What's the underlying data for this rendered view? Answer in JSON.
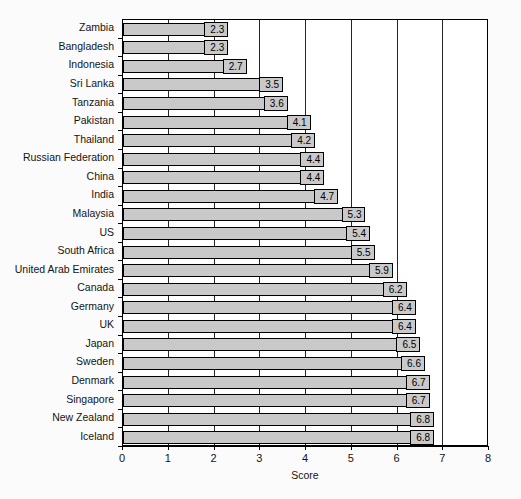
{
  "chart_data": {
    "type": "bar",
    "orientation": "horizontal",
    "title": "",
    "xlabel": "Score",
    "ylabel": "",
    "xlim": [
      0,
      8
    ],
    "xticks": [
      "0",
      "1",
      "2",
      "3",
      "4",
      "5",
      "6",
      "7",
      "8"
    ],
    "grid": "vertical",
    "legend": "none",
    "bar_fill_color": "#c9c9c9",
    "bar_border_color": "#000000",
    "categories": [
      "Zambia",
      "Bangladesh",
      "Indonesia",
      "Sri Lanka",
      "Tanzania",
      "Pakistan",
      "Thailand",
      "Russian Federation",
      "China",
      "India",
      "Malaysia",
      "US",
      "South Africa",
      "United Arab Emirates",
      "Canada",
      "Germany",
      "UK",
      "Japan",
      "Sweden",
      "Denmark",
      "Singapore",
      "New Zealand",
      "Iceland"
    ],
    "values": [
      2.3,
      2.3,
      2.7,
      3.5,
      3.6,
      4.1,
      4.2,
      4.4,
      4.4,
      4.7,
      5.3,
      5.4,
      5.5,
      5.9,
      6.2,
      6.4,
      6.4,
      6.5,
      6.6,
      6.7,
      6.7,
      6.8,
      6.8
    ],
    "data_labels": [
      "2.3",
      "2.3",
      "2.7",
      "3.5",
      "3.6",
      "4.1",
      "4.2",
      "4.4",
      "4.4",
      "4.7",
      "5.3",
      "5.4",
      "5.5",
      "5.9",
      "6.2",
      "6.4",
      "6.4",
      "6.5",
      "6.6",
      "6.7",
      "6.7",
      "6.8",
      "6.8"
    ]
  }
}
